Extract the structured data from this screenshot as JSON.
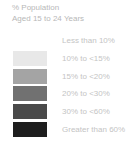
{
  "legend": {
    "title_line1": "% Population",
    "title_line2": "Aged 15 to 24 Years",
    "items": [
      {
        "label": "Less than 10%",
        "color": "#ffffff"
      },
      {
        "label": "10% to <15%",
        "color": "#e8e8e8"
      },
      {
        "label": "15% to <20%",
        "color": "#a4a4a4"
      },
      {
        "label": "20% to <30%",
        "color": "#717171"
      },
      {
        "label": "30% to <60%",
        "color": "#4a4a4a"
      },
      {
        "label": "Greater than 60%",
        "color": "#1e1e1e"
      }
    ]
  }
}
